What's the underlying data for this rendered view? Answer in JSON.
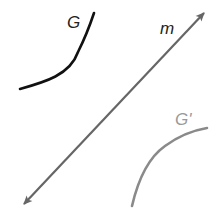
{
  "diagram": {
    "labels": {
      "curve_original": "G",
      "line": "m",
      "curve_image": "G'"
    },
    "colors": {
      "curve_original": "#111111",
      "line": "#666666",
      "curve_image": "#8a8a8a",
      "label_original": "#222222",
      "label_line": "#222222",
      "label_image": "#999999"
    }
  }
}
